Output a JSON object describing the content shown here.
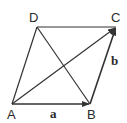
{
  "diagram": {
    "type": "parallelogram-vectors",
    "vertices": {
      "A": {
        "label": "A",
        "x": 12,
        "y": 104
      },
      "B": {
        "label": "B",
        "x": 90,
        "y": 104
      },
      "C": {
        "label": "C",
        "x": 116,
        "y": 27
      },
      "D": {
        "label": "D",
        "x": 37,
        "y": 27
      }
    },
    "vectors": [
      {
        "name": "a",
        "label": "a",
        "from": "A",
        "to": "B"
      },
      {
        "name": "b",
        "label": "b",
        "from": "B",
        "to": "C"
      },
      {
        "name": "AC",
        "label": "",
        "from": "A",
        "to": "C"
      }
    ],
    "edges": [
      [
        "A",
        "D"
      ],
      [
        "D",
        "C"
      ],
      [
        "D",
        "B"
      ]
    ],
    "stroke_color": "#333333"
  },
  "labels": {
    "A": "A",
    "B": "B",
    "C": "C",
    "D": "D",
    "a": "a",
    "b": "b"
  }
}
